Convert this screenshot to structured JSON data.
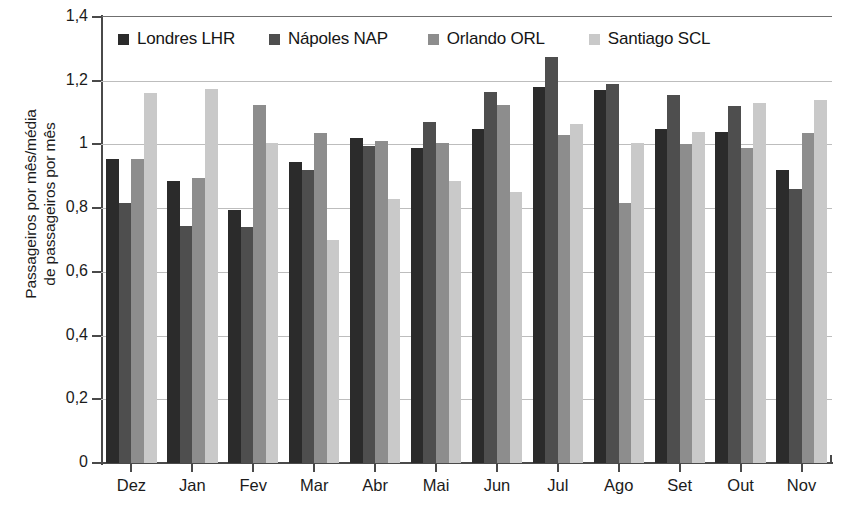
{
  "chart_data": {
    "type": "bar",
    "title": "",
    "subtitle": "",
    "xlabel": "",
    "ylabel": "Passageiros por mês/média\nde passageiros por mês",
    "ylim": [
      0,
      1.4
    ],
    "ytick_labels": [
      "1,4",
      "1,2",
      "1",
      "0,8",
      "0,6",
      "0,4",
      "0,2",
      "0"
    ],
    "ytick_values": [
      1.4,
      1.2,
      1.0,
      0.8,
      0.6,
      0.4,
      0.2,
      0
    ],
    "grid": true,
    "legend_position": "top-inside",
    "categories": [
      "Dez",
      "Jan",
      "Fev",
      "Mar",
      "Abr",
      "Mai",
      "Jun",
      "Jul",
      "Ago",
      "Set",
      "Out",
      "Nov"
    ],
    "series": [
      {
        "name": "Londres LHR",
        "color": "#2b2b2b",
        "values": [
          0.955,
          0.885,
          0.795,
          0.945,
          1.02,
          0.99,
          1.05,
          1.18,
          1.17,
          1.05,
          1.04,
          0.92
        ]
      },
      {
        "name": "Nápoles NAP",
        "color": "#4e4e4e",
        "values": [
          0.815,
          0.745,
          0.74,
          0.92,
          0.995,
          1.07,
          1.165,
          1.275,
          1.19,
          1.155,
          1.12,
          0.86
        ]
      },
      {
        "name": "Orlando ORL",
        "color": "#8d8d8d",
        "values": [
          0.955,
          0.895,
          1.125,
          1.035,
          1.01,
          1.005,
          1.125,
          1.03,
          0.815,
          1.0,
          0.99,
          1.035
        ]
      },
      {
        "name": "Santiago SCL",
        "color": "#c9c9c9",
        "values": [
          1.16,
          1.175,
          1.005,
          0.7,
          0.83,
          0.885,
          0.85,
          1.065,
          1.005,
          1.04,
          1.13,
          1.14
        ]
      }
    ]
  }
}
